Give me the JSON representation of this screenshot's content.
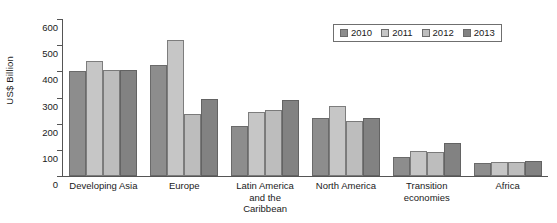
{
  "chart_data": {
    "type": "bar",
    "title": "",
    "xlabel": "",
    "ylabel": "US$ Billion",
    "ylim": [
      0,
      600
    ],
    "ytick_step": 100,
    "yticks": [
      600,
      500,
      400,
      300,
      200,
      100,
      0
    ],
    "grid": false,
    "legend_position": "top-right",
    "categories": [
      "Developing Asia",
      "Europe",
      "Latin America\nand the\nCaribbean",
      "North America",
      "Transition\neconomies",
      "Africa"
    ],
    "category_lines": [
      [
        "Developing Asia"
      ],
      [
        "Europe"
      ],
      [
        "Latin America",
        "and the",
        "Caribbean"
      ],
      [
        "North America"
      ],
      [
        "Transition",
        "economies"
      ],
      [
        "Africa"
      ]
    ],
    "series": [
      {
        "name": "2010",
        "color": "#8d8d8d",
        "values": [
          403,
          425,
          190,
          222,
          73,
          50
        ]
      },
      {
        "name": "2011",
        "color": "#c6c6c6",
        "values": [
          438,
          519,
          243,
          267,
          97,
          52
        ]
      },
      {
        "name": "2012",
        "color": "#bdbdbd",
        "values": [
          407,
          237,
          252,
          212,
          91,
          53
        ]
      },
      {
        "name": "2013",
        "color": "#828282",
        "values": [
          406,
          295,
          292,
          222,
          125,
          57
        ]
      }
    ]
  },
  "legend": {
    "items": [
      {
        "label": "2010"
      },
      {
        "label": "2011"
      },
      {
        "label": "2012"
      },
      {
        "label": "2013"
      }
    ]
  }
}
